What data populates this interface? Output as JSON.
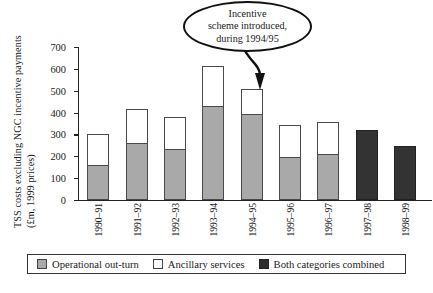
{
  "chart_data": {
    "type": "bar",
    "title": "",
    "subtitle": "",
    "xlabel": "",
    "ylabel": "TSS costs excluding NGC incentive payments (£m, 1999 prices)",
    "ylabel_line1": "TSS costs excluding NGC incentive payments",
    "ylabel_line2": "(£m, 1999 prices)",
    "ylim": [
      0,
      700
    ],
    "yticks": [
      0,
      100,
      200,
      300,
      400,
      500,
      600,
      700
    ],
    "grid": false,
    "stacked": true,
    "legend_position": "bottom",
    "categories": [
      "1990–91",
      "1991–92",
      "1992–93",
      "1993–94",
      "1994–95",
      "1995–96",
      "1996–97",
      "1997–98",
      "1998–99"
    ],
    "series": [
      {
        "name": "Operational out-turn",
        "color": "#a9a9a9",
        "values": [
          160,
          260,
          235,
          430,
          395,
          195,
          210,
          null,
          null
        ]
      },
      {
        "name": "Ancillary services",
        "color": "#ffffff",
        "values": [
          140,
          155,
          145,
          185,
          115,
          150,
          145,
          null,
          null
        ]
      },
      {
        "name": "Both categories combined",
        "color": "#2e2e2e",
        "values": [
          null,
          null,
          null,
          null,
          null,
          null,
          null,
          320,
          245
        ]
      }
    ],
    "totals": [
      300,
      415,
      380,
      615,
      510,
      345,
      355,
      320,
      245
    ],
    "annotations": [
      {
        "text": "Incentive scheme introduced, during 1994/95",
        "line1": "Incentive",
        "line2": "scheme introduced,",
        "line3": "during 1994/95",
        "points_to": "1994–95"
      }
    ]
  },
  "legend": {
    "items": [
      {
        "label": "Operational out-turn",
        "swatch": "ops"
      },
      {
        "label": "Ancillary services",
        "swatch": "anc"
      },
      {
        "label": "Both categories combined",
        "swatch": "both"
      }
    ]
  }
}
